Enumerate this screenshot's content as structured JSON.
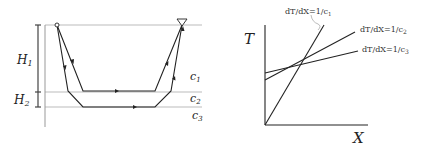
{
  "left_diagram": {
    "labels": {
      "h1": "H",
      "h1_sub": "1",
      "h2": "H",
      "h2_sub": "2",
      "c1": "c",
      "c1_sub": "1",
      "c2": "c",
      "c2_sub": "2",
      "c3": "c",
      "c3_sub": "3"
    },
    "symbols": {
      "source": "source-circle",
      "receiver": "receiver-triangle"
    },
    "layers": [
      "c1",
      "c2",
      "c3"
    ]
  },
  "right_chart": {
    "axis_labels": {
      "y": "T",
      "x": "X"
    },
    "line_labels": {
      "c1": "dT/dX=1/c",
      "c1_sub": "1",
      "c2": "dT/dX=1/c",
      "c2_sub": "2",
      "c3": "dT/dX=1/c",
      "c3_sub": "3"
    }
  },
  "colors": {
    "line": "#222222",
    "layer_boundary": "#bbbbbb",
    "leader": "#aaaaaa"
  }
}
